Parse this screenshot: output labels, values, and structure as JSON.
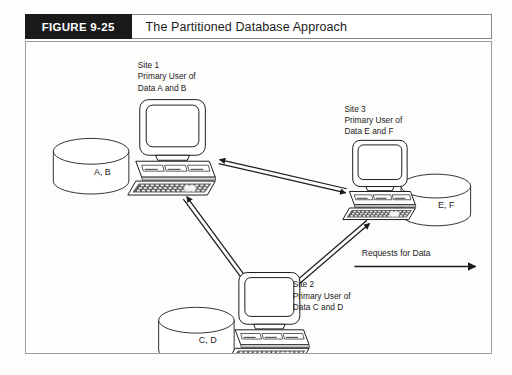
{
  "figure": {
    "tag": "FIGURE 9-25",
    "title": "The Partitioned Database Approach"
  },
  "colors": {
    "tag_background": "#1a1a1a",
    "tag_text": "#ffffff",
    "frame_border": "#9a9c9e",
    "header_border": "#86888a",
    "ink": "#1b1b1b",
    "page_background": "#fdfdfb",
    "device_fill": "#ffffff",
    "device_shade": "#d8d8d8",
    "device_dark": "#4a4a4a"
  },
  "sites": [
    {
      "id": "site-1",
      "name": "Site 1",
      "role": "Primary User of",
      "data": "Data A and B",
      "label_lines": [
        "Site 1",
        "Primary User of",
        "Data A and B"
      ],
      "label_x": 112,
      "label_y": 26,
      "label_anchor": "start",
      "computer": {
        "x": 110,
        "y": 58,
        "scale": 1.0
      }
    },
    {
      "id": "site-3",
      "name": "Site 3",
      "role": "Primary User of",
      "data": "Data E and F",
      "label_lines": [
        "Site 3",
        "Primary User of",
        "Data E and F"
      ],
      "label_x": 320,
      "label_y": 70,
      "label_anchor": "start",
      "computer": {
        "x": 325,
        "y": 99,
        "scale": 0.83
      }
    },
    {
      "id": "site-2",
      "name": "Site 2",
      "role": "Primary User of",
      "data": "Data C and D",
      "label_lines": [
        "Site 2",
        "Primary User of",
        "Data C and D"
      ],
      "label_x": 268,
      "label_y": 247,
      "label_anchor": "start",
      "computer": {
        "x": 210,
        "y": 232,
        "scale": 0.93
      }
    }
  ],
  "databases": [
    {
      "id": "db-ab",
      "label": "A, B",
      "cx": 65,
      "cy": 110,
      "rx": 38,
      "ry": 13,
      "body_height": 30
    },
    {
      "id": "db-ef",
      "label": "E, F",
      "cx": 412,
      "cy": 145,
      "rx": 35,
      "ry": 12,
      "body_height": 28
    },
    {
      "id": "db-cd",
      "label": "C, D",
      "cx": 171,
      "cy": 280,
      "rx": 38,
      "ry": 13,
      "body_height": 30
    }
  ],
  "links": [
    {
      "id": "link-site1-site3",
      "from": "site-1",
      "to": "site-3",
      "bidirectional": true
    },
    {
      "id": "link-site1-site2",
      "from": "site-1",
      "to": "site-2",
      "bidirectional": true
    },
    {
      "id": "link-site2-site3",
      "from": "site-2",
      "to": "site-3",
      "bidirectional": true
    }
  ],
  "legend": {
    "id": "requests-for-data",
    "label": "Requests for Data",
    "label_x": 372,
    "label_y": 215,
    "arrow": {
      "x1": 330,
      "y1": 226,
      "x2": 452,
      "y2": 226,
      "direction": "right"
    }
  }
}
